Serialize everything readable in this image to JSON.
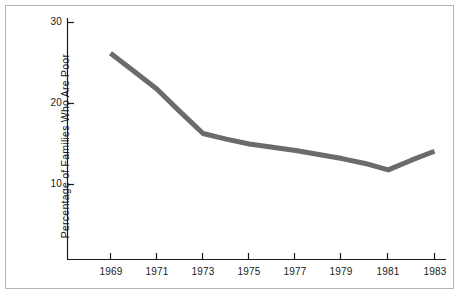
{
  "chart_data": {
    "type": "line",
    "title": "",
    "xlabel": "",
    "ylabel": "Percentage of Families Who Are Poor",
    "x": [
      1969,
      1970,
      1971,
      1972,
      1973,
      1974,
      1975,
      1976,
      1977,
      1978,
      1979,
      1980,
      1981,
      1982,
      1983
    ],
    "values": [
      26.2,
      24.0,
      21.8,
      19.0,
      16.3,
      15.6,
      15.0,
      14.6,
      14.2,
      13.7,
      13.2,
      12.6,
      11.8,
      13.0,
      14.1
    ],
    "xticks": [
      1969,
      1971,
      1973,
      1975,
      1977,
      1979,
      1981,
      1983
    ],
    "xtick_labels": [
      "1969",
      "1971",
      "1973",
      "1975",
      "1977",
      "1979",
      "1981",
      "1983"
    ],
    "yticks": [
      10,
      20,
      30
    ],
    "ytick_labels": [
      "10",
      "20",
      "30"
    ],
    "xlim": [
      1967.2,
      1983.8
    ],
    "ylim": [
      0,
      31.5
    ],
    "grid": false,
    "legend": null,
    "series_color": "#6b6b6b",
    "axis_color": "#1a1a1a",
    "line_width_px": 5
  },
  "figure": {
    "border_color": "#b5b5b5",
    "background": "#ffffff"
  }
}
